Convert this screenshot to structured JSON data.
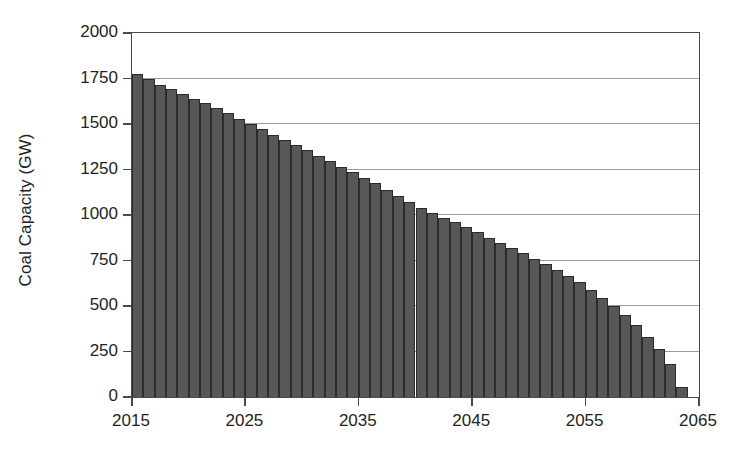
{
  "chart_data": {
    "type": "bar",
    "title": "",
    "subtitle": "",
    "xlabel": "",
    "ylabel": "Coal Capacity (GW)",
    "xlim": [
      2015,
      2065
    ],
    "ylim": [
      0,
      2000
    ],
    "ytick_labels": [
      "0",
      "250",
      "500",
      "750",
      "1000",
      "1250",
      "1500",
      "1750",
      "2000"
    ],
    "ytick_values": [
      0,
      250,
      500,
      750,
      1000,
      1250,
      1500,
      1750,
      2000
    ],
    "xtick_labels": [
      "2015",
      "2025",
      "2035",
      "2045",
      "2055",
      "2065"
    ],
    "xtick_values": [
      2015,
      2025,
      2035,
      2045,
      2055,
      2065
    ],
    "grid": "horizontal",
    "legend": "none",
    "bar_color": "#575757",
    "bar_edge_color": "#2b2b2b",
    "grid_color": "#9b9b9b",
    "axis_color": "#4a4a4a",
    "background_color": "#ffffff",
    "categories": [
      2015,
      2016,
      2017,
      2018,
      2019,
      2020,
      2021,
      2022,
      2023,
      2024,
      2025,
      2026,
      2027,
      2028,
      2029,
      2030,
      2031,
      2032,
      2033,
      2034,
      2035,
      2036,
      2037,
      2038,
      2039,
      2040,
      2041,
      2042,
      2043,
      2044,
      2045,
      2046,
      2047,
      2048,
      2049,
      2050,
      2051,
      2052,
      2053,
      2054,
      2055,
      2056,
      2057,
      2058,
      2059,
      2060,
      2061,
      2062,
      2063
    ],
    "values": [
      1775,
      1745,
      1715,
      1690,
      1665,
      1640,
      1615,
      1590,
      1560,
      1530,
      1500,
      1470,
      1440,
      1410,
      1385,
      1355,
      1325,
      1295,
      1265,
      1235,
      1205,
      1175,
      1140,
      1105,
      1070,
      1040,
      1010,
      985,
      960,
      935,
      905,
      875,
      845,
      820,
      790,
      760,
      730,
      700,
      665,
      630,
      590,
      545,
      500,
      450,
      395,
      330,
      265,
      180,
      55
    ]
  }
}
